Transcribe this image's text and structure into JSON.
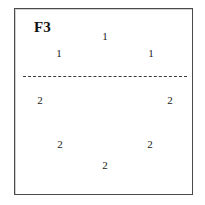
{
  "figure": {
    "label": "F3",
    "background_color": "#ffffff",
    "frame_color": "#4a4a4a",
    "text_color": "#1a1a1a"
  },
  "separation_line": {
    "name": "dashed-separation-line",
    "style": "dashed",
    "orientation": "horizontal",
    "color": "#3a3a3a",
    "y": 75,
    "x_start": 22,
    "x_end": 186
  },
  "chart_data": {
    "type": "scatter",
    "title": "F3",
    "xlabel": "",
    "ylabel": "",
    "xlim": [
      0,
      179
    ],
    "ylim": [
      0,
      187
    ],
    "grid": false,
    "legend": "none",
    "annotations": [
      {
        "text": "horizontal dashed line separating group 1 (above) from group 2 (below)",
        "type": "separation-line",
        "y": 75
      }
    ],
    "series": [
      {
        "name": "1",
        "label": "1",
        "points": [
          {
            "label": "1",
            "x": 104,
            "y": 35
          },
          {
            "label": "1",
            "x": 58,
            "y": 52
          },
          {
            "label": "1",
            "x": 150,
            "y": 52
          }
        ]
      },
      {
        "name": "2",
        "label": "2",
        "points": [
          {
            "label": "2",
            "x": 39,
            "y": 99
          },
          {
            "label": "2",
            "x": 169,
            "y": 99
          },
          {
            "label": "2",
            "x": 59,
            "y": 143
          },
          {
            "label": "2",
            "x": 149,
            "y": 143
          },
          {
            "label": "2",
            "x": 104,
            "y": 164
          }
        ]
      }
    ]
  }
}
